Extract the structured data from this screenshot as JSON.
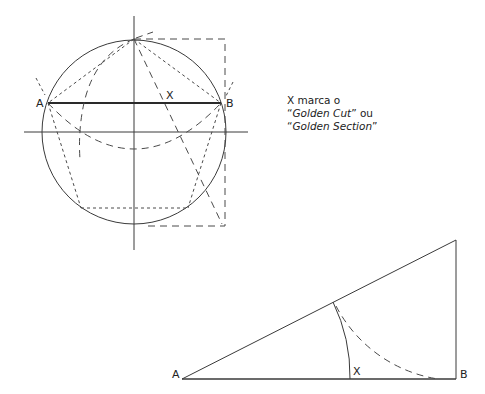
{
  "diagram": {
    "circle_figure": {
      "labels": {
        "point_a": "A",
        "point_b": "B",
        "point_x": "X"
      },
      "circle": {
        "cx": 134,
        "cy": 132,
        "r": 92
      },
      "segment_ab": {
        "a": [
          48,
          103
        ],
        "b": [
          221,
          103
        ]
      }
    },
    "caption": {
      "line1": "X marca o",
      "line2_quote_open": "“",
      "line2_em": "Golden Cut",
      "line2_rest": "” ou",
      "line3_quote_open": "“",
      "line3_em": "Golden Section",
      "line3_quote_close": "”"
    },
    "triangle_figure": {
      "labels": {
        "point_a": "A",
        "point_b": "B",
        "point_x": "X"
      },
      "vertices": {
        "a": [
          182,
          379
        ],
        "b": [
          456,
          379
        ],
        "top": [
          456,
          240
        ]
      }
    }
  }
}
